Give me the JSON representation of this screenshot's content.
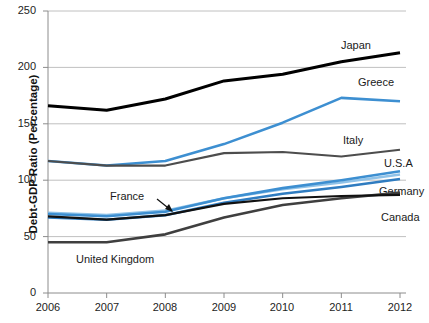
{
  "chart_data": {
    "type": "line",
    "title": "",
    "xlabel": "",
    "ylabel": "Debt-GDP Ratio (Percentage)",
    "x": [
      2006,
      2007,
      2008,
      2009,
      2010,
      2011,
      2012
    ],
    "xticklabels": [
      "2006",
      "2007",
      "2008",
      "2009",
      "2010",
      "2011",
      "2012"
    ],
    "yticklabels": [
      "0",
      "50",
      "100",
      "150",
      "200",
      "250"
    ],
    "yticks": [
      0,
      50,
      100,
      150,
      200,
      250
    ],
    "ylim": [
      0,
      250
    ],
    "xlim": [
      2006,
      2012
    ],
    "grid": "horizontal",
    "legend": "inline-right-labels",
    "series": [
      {
        "name": "Japan",
        "color": "#000000",
        "width": 3.0,
        "values": [
          166,
          162,
          172,
          188,
          194,
          205,
          213
        ]
      },
      {
        "name": "Greece",
        "color": "#3d8fd1",
        "width": 2.6,
        "values": [
          117,
          113,
          117,
          132,
          151,
          173,
          170
        ]
      },
      {
        "name": "Italy",
        "color": "#4d4d4d",
        "width": 2.2,
        "values": [
          117,
          113,
          113,
          124,
          125,
          121,
          127
        ]
      },
      {
        "name": "U.S.A",
        "color": "#3d8fd1",
        "width": 2.6,
        "values": [
          70,
          68,
          72,
          84,
          93,
          100,
          108
        ]
      },
      {
        "name": "France",
        "color": "#8fc2e8",
        "width": 2.6,
        "values": [
          71,
          69,
          73,
          84,
          92,
          98,
          105
        ]
      },
      {
        "name": "Germany",
        "color": "#2f7cc0",
        "width": 2.6,
        "values": [
          67,
          65,
          69,
          80,
          88,
          94,
          101
        ]
      },
      {
        "name": "Canada",
        "color": "#111111",
        "width": 2.2,
        "values": [
          68,
          65,
          69,
          79,
          84,
          86,
          87
        ]
      },
      {
        "name": "United Kingdom",
        "color": "#3f3f3f",
        "width": 2.6,
        "values": [
          45,
          45,
          52,
          67,
          78,
          84,
          89
        ]
      }
    ],
    "annotations": [
      {
        "text": "France",
        "target_series": "France",
        "kind": "arrow-callout"
      },
      {
        "text": "United Kingdom",
        "target_series": "United Kingdom",
        "kind": "inline-label"
      }
    ]
  },
  "axis": {
    "y_title": "Debt-GDP Ratio (Percentage)",
    "yticks": [
      "250",
      "200",
      "150",
      "100",
      "50",
      "0"
    ],
    "xticks": [
      "2006",
      "2007",
      "2008",
      "2009",
      "2010",
      "2011",
      "2012"
    ]
  },
  "labels": {
    "japan": "Japan",
    "greece": "Greece",
    "italy": "Italy",
    "usa": "U.S.A",
    "germany": "Germany",
    "canada": "Canada",
    "france": "France",
    "united_kingdom": "United Kingdom"
  },
  "colors": {
    "japan": "#000000",
    "greece": "#3d8fd1",
    "italy": "#4d4d4d",
    "usa": "#3d8fd1",
    "france": "#8fc2e8",
    "germany": "#2f7cc0",
    "canada": "#111111",
    "united_kingdom": "#3f3f3f",
    "grid": "#b9b9b9",
    "axis": "#8c8c8c",
    "background": "#ffffff"
  }
}
